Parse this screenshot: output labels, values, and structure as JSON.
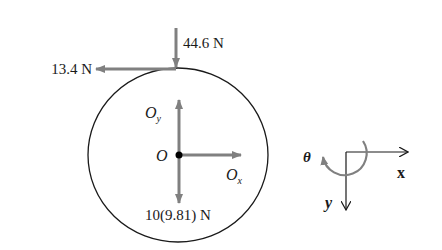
{
  "diagram": {
    "type": "free-body-diagram",
    "body": "disk",
    "colors": {
      "force_arrow": "#808080",
      "outline": "#1a1a1a",
      "background": "#ffffff"
    },
    "forces": {
      "vertical_top": {
        "label": "44.6 N",
        "direction": "down"
      },
      "horizontal_top": {
        "label": "13.4 N",
        "direction": "left"
      },
      "weight": {
        "label": "10(9.81) N",
        "direction": "down"
      },
      "reaction_y": {
        "label_main": "O",
        "label_sub": "y",
        "direction": "up"
      },
      "reaction_x": {
        "label_main": "O",
        "label_sub": "x",
        "direction": "right"
      }
    },
    "pin": {
      "label": "O"
    },
    "coordinate_frame": {
      "x_label": "x",
      "y_label": "y",
      "rotation_label": "θ"
    }
  }
}
